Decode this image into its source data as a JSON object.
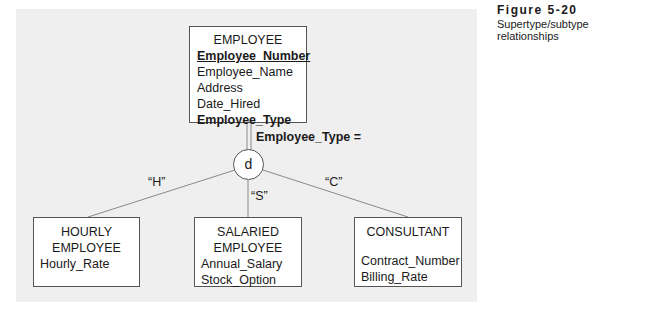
{
  "caption": {
    "figure": "Figure 5-20",
    "description": "Supertype/subtype relationships"
  },
  "supertype": {
    "name": "EMPLOYEE",
    "identifier": "Employee_Number",
    "attributes": [
      "Employee_Name",
      "Address",
      "Date_Hired"
    ],
    "discriminator": "Employee_Type"
  },
  "discriminator": {
    "label": "Employee_Type =",
    "constraint": "d"
  },
  "subtypes": [
    {
      "name_line1": "HOURLY",
      "name_line2": "EMPLOYEE",
      "attributes": [
        "Hourly_Rate"
      ],
      "value": "“H”"
    },
    {
      "name_line1": "SALARIED",
      "name_line2": "EMPLOYEE",
      "attributes": [
        "Annual_Salary",
        "Stock_Option"
      ],
      "value": "“S”"
    },
    {
      "name_line1": "CONSULTANT",
      "attributes": [
        "Contract_Number",
        "Billing_Rate"
      ],
      "value": "“C”"
    }
  ],
  "colors": {
    "panel_background": "#efefef",
    "box_border": "#555555",
    "line": "#8a8a8a"
  }
}
